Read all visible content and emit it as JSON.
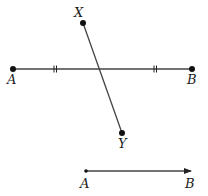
{
  "diagram": {
    "segment_AB": {
      "start_label": "A",
      "end_label": "B",
      "start": [
        13,
        69
      ],
      "end": [
        192,
        69
      ],
      "congruence_marks": "||"
    },
    "segment_XY": {
      "start_label": "X",
      "end_label": "Y",
      "start": [
        83,
        23
      ],
      "end": [
        122,
        133
      ]
    },
    "ray_AB": {
      "start_label": "A",
      "end_label": "B",
      "start": [
        86,
        171
      ],
      "end": [
        192,
        171
      ]
    },
    "colors": {
      "line": "#444444",
      "point": "#111111",
      "label": "#222222"
    }
  }
}
